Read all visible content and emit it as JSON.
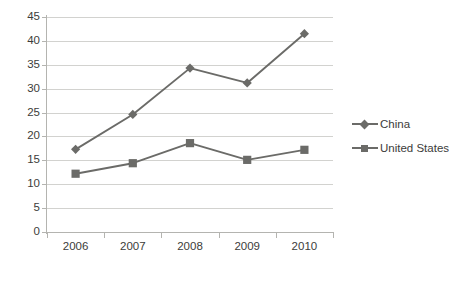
{
  "chart_data": {
    "type": "line",
    "title": "",
    "subtitle": "",
    "xlabel": "",
    "ylabel": "",
    "categories": [
      "2006",
      "2007",
      "2008",
      "2009",
      "2010"
    ],
    "series": [
      {
        "name": "China",
        "marker": "diamond",
        "color": "#6b6b68",
        "values": [
          17.3,
          24.6,
          34.3,
          31.2,
          41.5
        ]
      },
      {
        "name": "United States",
        "marker": "square",
        "color": "#6b6b68",
        "values": [
          12.2,
          14.4,
          18.6,
          15.1,
          17.2
        ]
      }
    ],
    "ylim": [
      0,
      45
    ],
    "ytick_step": 5,
    "yticks": [
      "0",
      "5",
      "10",
      "15",
      "20",
      "25",
      "30",
      "35",
      "40",
      "45"
    ],
    "grid": true,
    "legend_position": "right",
    "colors": {
      "line": "#6b6b68",
      "marker": "#6b6b68",
      "gridline": "#d2d2cf",
      "axis": "#b4b4b0",
      "text": "#3c3c3a",
      "background": "#ffffff"
    }
  }
}
